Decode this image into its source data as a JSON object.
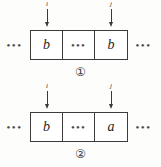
{
  "figure": {
    "background_color": "#fdfdfc",
    "ink_color": "#3a3a3a",
    "leading_ellipsis": "•••",
    "trailing_ellipsis": "•••",
    "diagrams": [
      {
        "caption": "①",
        "caption_text": "1",
        "pointers": [
          {
            "label": "i",
            "target_cell": 0
          },
          {
            "label": "j",
            "target_cell": 2
          }
        ],
        "cells": [
          {
            "symbol": "b",
            "kind": "symbol"
          },
          {
            "symbol": "•••",
            "kind": "gap"
          },
          {
            "symbol": "b",
            "kind": "symbol"
          }
        ]
      },
      {
        "caption": "②",
        "caption_text": "2",
        "pointers": [
          {
            "label": "i",
            "target_cell": 0
          },
          {
            "label": "j",
            "target_cell": 2
          }
        ],
        "cells": [
          {
            "symbol": "b",
            "kind": "symbol"
          },
          {
            "symbol": "•••",
            "kind": "gap"
          },
          {
            "symbol": "a",
            "kind": "symbol"
          }
        ]
      }
    ]
  }
}
